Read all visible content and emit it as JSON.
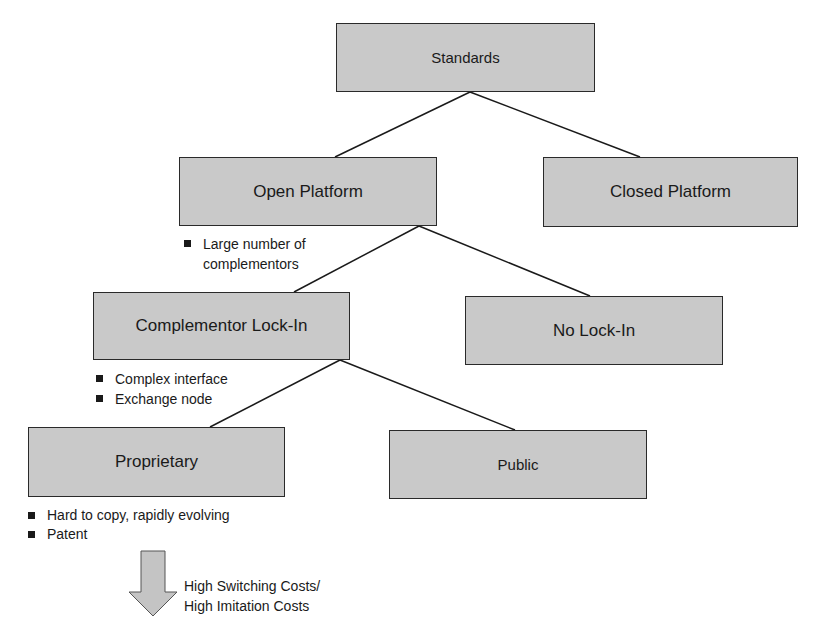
{
  "diagram": {
    "type": "tree",
    "nodes": {
      "standards": {
        "label": "Standards"
      },
      "open_platform": {
        "label": "Open Platform"
      },
      "closed_platform": {
        "label": "Closed Platform"
      },
      "complementor_lockin": {
        "label": "Complementor Lock-In"
      },
      "no_lockin": {
        "label": "No Lock-In"
      },
      "proprietary": {
        "label": "Proprietary"
      },
      "public": {
        "label": "Public"
      }
    },
    "edges": [
      {
        "from": "Standards",
        "to": "Open Platform"
      },
      {
        "from": "Standards",
        "to": "Closed Platform"
      },
      {
        "from": "Open Platform",
        "to": "Complementor Lock-In"
      },
      {
        "from": "Open Platform",
        "to": "No Lock-In"
      },
      {
        "from": "Complementor Lock-In",
        "to": "Proprietary"
      },
      {
        "from": "Complementor Lock-In",
        "to": "Public"
      }
    ],
    "notes": {
      "open_platform": [
        "Large number of",
        "complementors"
      ],
      "complementor_lockin": [
        "Complex interface",
        "Exchange node"
      ],
      "proprietary": [
        "Hard to copy, rapidly evolving",
        "Patent"
      ]
    },
    "outcome": {
      "line1": "High Switching Costs/",
      "line2": "High Imitation Costs"
    }
  },
  "colors": {
    "box_fill": "#c9c9c9",
    "box_border": "#2a2a2a",
    "line": "#1a1a1a",
    "arrow_fill": "#c4c4c4",
    "text": "#1a1a1a"
  }
}
